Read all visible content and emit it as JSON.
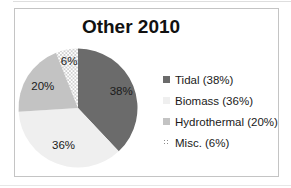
{
  "chart_data": {
    "type": "pie",
    "title": "Other 2010",
    "categories": [
      "Tidal",
      "Biomass",
      "Hydrothermal",
      "Misc."
    ],
    "values": [
      38,
      36,
      20,
      6
    ],
    "unit": "%",
    "slice_labels": [
      "38%",
      "36%",
      "20%",
      "6%"
    ],
    "legend_labels": [
      "Tidal (38%)",
      "Biomass (36%)",
      "Hydrothermal (20%)",
      "Misc. (6%)"
    ],
    "colors": [
      "#6b6b6b",
      "#efefef",
      "#c3c3c3",
      "pattern-dots"
    ],
    "dot_color": "#8c8c8c",
    "legend_position": "right",
    "start_angle_deg": 0,
    "direction": "clockwise",
    "grid": "off"
  },
  "colors": {
    "background": "#ffffff",
    "frame_border": "#c4c4c4",
    "title_text": "#111111",
    "label_text": "#1a1a1a"
  }
}
